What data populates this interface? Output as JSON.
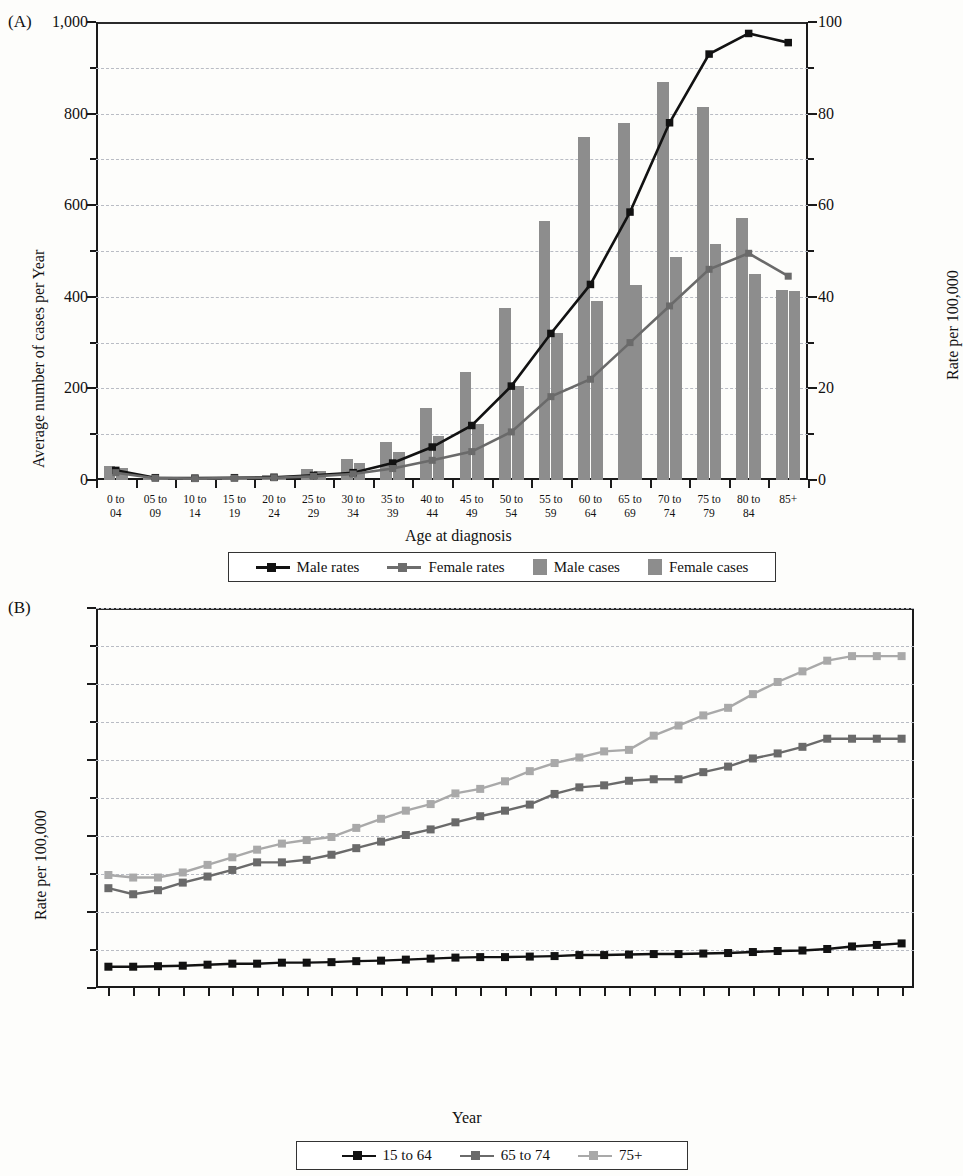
{
  "figure": {
    "panels": [
      "A",
      "B"
    ]
  },
  "panelA": {
    "tag": "(A)",
    "y_left_title": "Average number of cases per Year",
    "y_right_title": "Rate per 100,000",
    "x_title": "Age at diagnosis",
    "y_left_ticks": [
      "0",
      "200",
      "400",
      "600",
      "800",
      "1,000"
    ],
    "y_right_ticks": [
      "0",
      "20",
      "40",
      "60",
      "80",
      "100"
    ],
    "legend": [
      {
        "label": "Male rates",
        "type": "line",
        "color": "#121212"
      },
      {
        "label": "Female rates",
        "type": "line",
        "color": "#6d6d6d"
      },
      {
        "label": "Male cases",
        "type": "bar",
        "color": "#8d8d8d"
      },
      {
        "label": "Female cases",
        "type": "bar",
        "color": "#8d8d8d"
      }
    ]
  },
  "panelB": {
    "tag": "(B)",
    "y_title": "Rate per 100,000",
    "x_title": "Year",
    "y_ticks": [
      "0",
      "15",
      "30",
      "45",
      "60",
      "75"
    ],
    "legend": [
      {
        "label": "15 to 64",
        "color": "#121212"
      },
      {
        "label": "65 to 74",
        "color": "#6a6a6a"
      },
      {
        "label": "75+",
        "color": "#a9a9a9"
      }
    ]
  },
  "chart_data": [
    {
      "type": "bar",
      "id": "panel-A",
      "title": "(A)",
      "xlabel": "Age at diagnosis",
      "ylabel": "Average number of cases per Year",
      "y2label": "Rate per 100,000",
      "ylim": [
        0,
        1000
      ],
      "y2lim": [
        0,
        100
      ],
      "yticks": [
        0,
        200,
        400,
        600,
        800,
        1000
      ],
      "y2ticks": [
        0,
        20,
        40,
        60,
        80,
        100
      ],
      "grid": true,
      "legend_position": "bottom",
      "categories": [
        "0 to 04",
        "05 to 09",
        "10 to 14",
        "15 to 19",
        "20 to 24",
        "25 to 29",
        "30 to 34",
        "35 to 39",
        "40 to 44",
        "45 to 49",
        "50 to 54",
        "55 to 59",
        "60 to 64",
        "65 to 69",
        "70 to 74",
        "75 to 79",
        "80 to 84",
        "85+"
      ],
      "series": [
        {
          "name": "Male cases",
          "kind": "bar",
          "axis": "left",
          "values": [
            30,
            7,
            6,
            7,
            10,
            24,
            45,
            82,
            158,
            235,
            375,
            565,
            748,
            780,
            870,
            815,
            573,
            414
          ]
        },
        {
          "name": "Female cases",
          "kind": "bar",
          "axis": "left",
          "values": [
            27,
            6,
            5,
            6,
            9,
            20,
            38,
            62,
            96,
            122,
            205,
            320,
            390,
            425,
            488,
            515,
            450,
            412
          ]
        },
        {
          "name": "Male rates",
          "kind": "line",
          "axis": "right",
          "values": [
            2.1,
            0.5,
            0.4,
            0.5,
            0.6,
            1.0,
            1.6,
            3.7,
            7.2,
            11.9,
            20.5,
            32.0,
            42.7,
            58.5,
            78.0,
            93.0,
            97.5,
            95.5
          ]
        },
        {
          "name": "Female rates",
          "kind": "line",
          "axis": "right",
          "values": [
            1.6,
            0.4,
            0.3,
            0.4,
            0.5,
            0.8,
            1.3,
            2.5,
            4.3,
            6.2,
            10.5,
            18.2,
            22.0,
            30.0,
            38.0,
            46.0,
            49.5,
            44.5
          ]
        }
      ]
    },
    {
      "type": "line",
      "id": "panel-B",
      "title": "(B)",
      "xlabel": "Year",
      "ylabel": "Rate per 100,000",
      "ylim": [
        0,
        75
      ],
      "yticks": [
        0,
        15,
        30,
        45,
        60,
        75
      ],
      "grid": true,
      "legend_position": "bottom",
      "categories": [
        "1975–1977",
        "1976–1978",
        "1977–1979",
        "1978–1980",
        "1979–1981",
        "1980–1982",
        "1981–1983",
        "1982–1984",
        "1983–1985",
        "1984–1986",
        "1985–1987",
        "1986–1988",
        "1987–1989",
        "1988–1990",
        "1989–1991",
        "1990–1992",
        "1991–1993",
        "1992–1994",
        "1993–1995",
        "1994–1996",
        "1995–1997",
        "1996–1998",
        "1997–1999",
        "1998–2000",
        "1999–2001",
        "2000–2002",
        "2001–2003",
        "2002–2004",
        "2003–2005",
        "2004–2006",
        "2005–2007",
        "2006–2008",
        "2007–2009"
      ],
      "series": [
        {
          "name": "15 to 64",
          "values": [
            4.2,
            4.2,
            4.3,
            4.4,
            4.6,
            4.8,
            4.8,
            5.0,
            5.0,
            5.1,
            5.3,
            5.4,
            5.6,
            5.8,
            6.0,
            6.1,
            6.1,
            6.2,
            6.3,
            6.5,
            6.5,
            6.6,
            6.7,
            6.7,
            6.8,
            6.9,
            7.1,
            7.3,
            7.4,
            7.7,
            8.2,
            8.5,
            8.8
          ]
        },
        {
          "name": "65 to 74",
          "values": [
            19.7,
            18.5,
            19.3,
            20.8,
            22.0,
            23.3,
            24.8,
            24.8,
            25.3,
            26.3,
            27.6,
            28.9,
            30.2,
            31.3,
            32.7,
            33.9,
            35.0,
            36.2,
            38.3,
            39.6,
            40.0,
            40.9,
            41.2,
            41.2,
            42.6,
            43.7,
            45.3,
            46.3,
            47.6,
            49.2,
            49.2,
            49.2,
            49.2
          ]
        },
        {
          "name": "75+",
          "values": [
            22.3,
            21.8,
            21.8,
            22.8,
            24.3,
            25.8,
            27.3,
            28.5,
            29.2,
            29.8,
            31.6,
            33.4,
            35.0,
            36.3,
            38.4,
            39.3,
            40.8,
            42.8,
            44.4,
            45.5,
            46.7,
            47.0,
            49.8,
            51.8,
            53.8,
            55.3,
            58.0,
            60.4,
            62.5,
            64.6,
            65.5,
            65.5,
            65.5
          ]
        }
      ]
    }
  ]
}
